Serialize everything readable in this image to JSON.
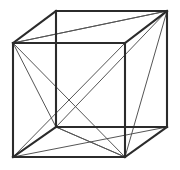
{
  "figure": {
    "kind": "line-drawing",
    "projection": "oblique-parallel",
    "background_color": "#ffffff",
    "edge_color": "#2b2b2b",
    "diagonal_color": "#555555",
    "edge_width": 2.1,
    "diagonal_width": 1.0,
    "canvas": {
      "width": 180,
      "height": 170
    },
    "vertices": {
      "front_top_left": {
        "label": "FTL",
        "x": 13,
        "y": 43
      },
      "front_top_right": {
        "label": "FTR",
        "x": 125,
        "y": 43
      },
      "front_bottom_right": {
        "label": "FBR",
        "x": 125,
        "y": 157
      },
      "front_bottom_left": {
        "label": "FBL",
        "x": 13,
        "y": 157
      },
      "back_top_left": {
        "label": "BTL",
        "x": 56,
        "y": 11
      },
      "back_top_right": {
        "label": "BTR",
        "x": 167,
        "y": 11
      },
      "back_bottom_right": {
        "label": "BBR",
        "x": 167,
        "y": 127
      },
      "back_bottom_left": {
        "label": "BBL",
        "x": 56,
        "y": 127
      }
    },
    "edges": [
      {
        "name": "front-top-edge",
        "from": "front_top_left",
        "to": "front_top_right"
      },
      {
        "name": "front-right-edge",
        "from": "front_top_right",
        "to": "front_bottom_right"
      },
      {
        "name": "front-bottom-edge",
        "from": "front_bottom_right",
        "to": "front_bottom_left"
      },
      {
        "name": "front-left-edge",
        "from": "front_bottom_left",
        "to": "front_top_left"
      },
      {
        "name": "back-top-edge",
        "from": "back_top_left",
        "to": "back_top_right"
      },
      {
        "name": "back-right-edge",
        "from": "back_top_right",
        "to": "back_bottom_right"
      },
      {
        "name": "back-bottom-edge",
        "from": "back_bottom_right",
        "to": "back_bottom_left"
      },
      {
        "name": "back-left-edge",
        "from": "back_bottom_left",
        "to": "back_top_left"
      },
      {
        "name": "connector-top-left",
        "from": "front_top_left",
        "to": "back_top_left"
      },
      {
        "name": "connector-top-right",
        "from": "front_top_right",
        "to": "back_top_right"
      },
      {
        "name": "connector-bottom-right",
        "from": "front_bottom_right",
        "to": "back_bottom_right"
      },
      {
        "name": "connector-bottom-left",
        "from": "front_bottom_left",
        "to": "back_bottom_left"
      }
    ],
    "diagonals": [
      {
        "name": "front-face-diagonal-a",
        "from": "front_top_left",
        "to": "front_bottom_right"
      },
      {
        "name": "front-face-diagonal-b",
        "from": "front_top_right",
        "to": "front_bottom_left"
      },
      {
        "name": "top-face-diagonal",
        "from": "front_top_left",
        "to": "back_top_right"
      },
      {
        "name": "left-face-diagonal",
        "from": "front_top_left",
        "to": "back_bottom_left"
      },
      {
        "name": "bottom-face-diagonal",
        "from": "front_bottom_left",
        "to": "back_bottom_right"
      },
      {
        "name": "bottom-face-diagonal-b",
        "from": "back_bottom_left",
        "to": "front_bottom_right"
      },
      {
        "name": "right-face-diagonal",
        "from": "back_top_right",
        "to": "front_bottom_right"
      },
      {
        "name": "space-diagonal-a",
        "from": "back_top_right",
        "to": "back_bottom_left"
      },
      {
        "name": "space-diagonal-b",
        "from": "front_top_left",
        "to": "back_top_right"
      },
      {
        "name": "space-diagonal-c",
        "from": "back_bottom_left",
        "to": "front_bottom_right"
      }
    ]
  }
}
